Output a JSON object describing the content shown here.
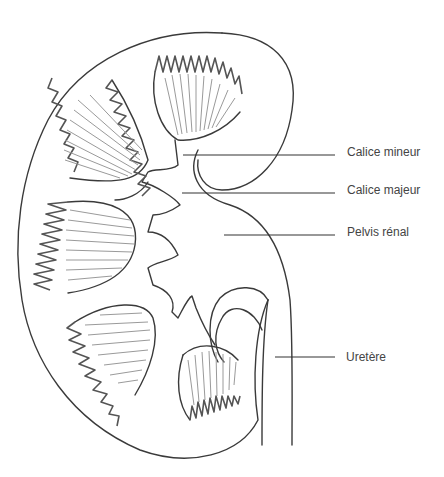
{
  "diagram": {
    "style": "hand-drawn pencil illustration",
    "colors": {
      "line": "#3a3a3a",
      "rays": "#9a9a9a",
      "label_text": "#444444",
      "background": "#ffffff"
    },
    "labels": [
      {
        "id": "calice-mineur",
        "text": "Calice mineur",
        "x": 347,
        "y": 145,
        "leader": {
          "x1": 183,
          "y1": 155,
          "x2": 335,
          "y2": 155
        }
      },
      {
        "id": "calice-majeur",
        "text": "Calice majeur",
        "x": 347,
        "y": 183,
        "leader": {
          "x1": 182,
          "y1": 193,
          "x2": 335,
          "y2": 193
        }
      },
      {
        "id": "pelvis-renal",
        "text": "Pelvis rénal",
        "x": 347,
        "y": 225,
        "leader": {
          "x1": 224,
          "y1": 235,
          "x2": 335,
          "y2": 235
        }
      },
      {
        "id": "uretere",
        "text": "Uretère",
        "x": 346,
        "y": 350,
        "leader": {
          "x1": 275,
          "y1": 357,
          "x2": 335,
          "y2": 357
        }
      }
    ]
  }
}
